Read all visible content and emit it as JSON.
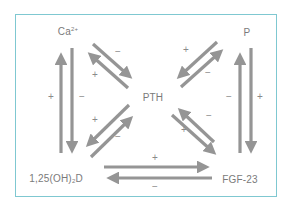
{
  "diagram": {
    "type": "regulatory-feedback-network",
    "frame_color": "#7fc8d1",
    "arrow_color": "#959595",
    "text_color": "#7a7a7a",
    "nodes": {
      "ca": {
        "base": "Ca",
        "sup": "2+"
      },
      "p": {
        "label": "P"
      },
      "pth": {
        "label": "PTH"
      },
      "vitd": {
        "pre": "1,25(OH)",
        "sub": "2",
        "post": "D"
      },
      "fgf": {
        "label": "FGF-23"
      }
    },
    "edges": [
      {
        "from": "1,25(OH)2D",
        "to": "Ca2+",
        "sign": "+"
      },
      {
        "from": "Ca2+",
        "to": "1,25(OH)2D",
        "sign": "−"
      },
      {
        "from": "Ca2+",
        "to": "PTH",
        "sign": "−"
      },
      {
        "from": "PTH",
        "to": "Ca2+",
        "sign": "+"
      },
      {
        "from": "P",
        "to": "PTH",
        "sign": "+"
      },
      {
        "from": "PTH",
        "to": "P",
        "sign": "−"
      },
      {
        "from": "FGF-23",
        "to": "P",
        "sign": "−"
      },
      {
        "from": "P",
        "to": "FGF-23",
        "sign": "+"
      },
      {
        "from": "PTH",
        "to": "1,25(OH)2D",
        "sign": "+"
      },
      {
        "from": "1,25(OH)2D",
        "to": "PTH",
        "sign": "−"
      },
      {
        "from": "FGF-23",
        "to": "PTH",
        "sign": "−"
      },
      {
        "from": "PTH",
        "to": "FGF-23",
        "sign": "+"
      },
      {
        "from": "1,25(OH)2D",
        "to": "FGF-23",
        "sign": "+"
      },
      {
        "from": "FGF-23",
        "to": "1,25(OH)2D",
        "sign": "−"
      }
    ],
    "signs": {
      "left_up": "+",
      "left_down": "−",
      "right_up": "−",
      "right_down": "+",
      "tl_to_pth": "−",
      "tl_to_ca": "+",
      "tr_to_pth": "+",
      "tr_to_p": "−",
      "bl_to_vitd": "+",
      "bl_to_pth": "−",
      "br_to_pth": "−",
      "br_to_fgf": "+",
      "bottom_right": "+",
      "bottom_left": "−"
    }
  }
}
